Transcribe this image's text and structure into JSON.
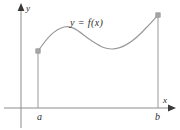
{
  "figure": {
    "name": "graph-of-function-on-closed-interval",
    "background_color": "#ffffff",
    "stroke_color": "#9a9a9a",
    "axis_color": "#8c8c8c",
    "text_color": "#2b2b2b",
    "labels": {
      "y_axis": "y",
      "x_axis": "x",
      "left_endpoint": "a",
      "right_endpoint": "b",
      "curve": "y = f(x)"
    }
  },
  "chart_data": {
    "type": "line",
    "title": "",
    "xlabel": "x",
    "ylabel": "y",
    "curve_label": "y = f(x)",
    "grid": false,
    "legend": null,
    "axis_ticks": {
      "x": [
        "a",
        "b"
      ],
      "y": []
    },
    "interval": {
      "start_label": "a",
      "end_label": "b"
    },
    "endpoint_markers": [
      {
        "label": "a",
        "x": 38,
        "y": 51,
        "shape": "square"
      },
      {
        "label": "b",
        "x": 158,
        "y": 15,
        "shape": "square"
      }
    ],
    "vertical_drop_lines": [
      {
        "label": "a",
        "x": 38,
        "y_top": 51,
        "y_bottom": 108
      },
      {
        "label": "b",
        "x": 158,
        "y_top": 15,
        "y_bottom": 108
      }
    ],
    "curve_points_px": [
      [
        38,
        51
      ],
      [
        48,
        38
      ],
      [
        56,
        31
      ],
      [
        64,
        27
      ],
      [
        72,
        27
      ],
      [
        82,
        32
      ],
      [
        92,
        40
      ],
      [
        102,
        47
      ],
      [
        110,
        49
      ],
      [
        120,
        47
      ],
      [
        132,
        40
      ],
      [
        144,
        30
      ],
      [
        152,
        22
      ],
      [
        158,
        15
      ]
    ],
    "curve_path": "M 38 51 C 44 43, 52 30, 64 27 C 74 25, 80 33, 92 41 C 100 46, 104 49, 112 49 C 124 49, 136 39, 146 28 C 152 22, 156 17, 158 15",
    "axes_px": {
      "x_axis_y": 108,
      "x_axis_x_start": 4,
      "x_axis_x_end": 174,
      "y_axis_x": 21,
      "y_axis_y_top": 6,
      "y_axis_y_bottom": 128
    }
  }
}
